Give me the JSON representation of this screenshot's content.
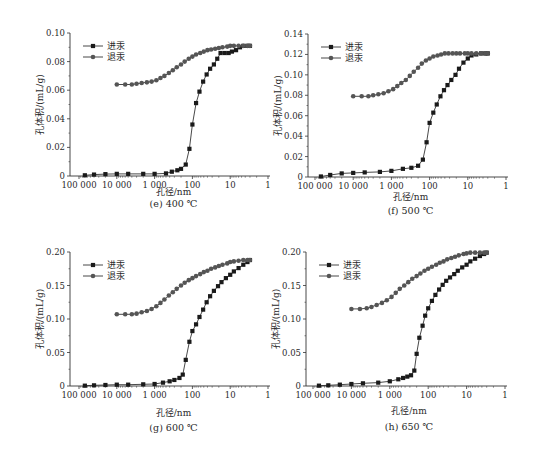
{
  "figure": {
    "series_names": {
      "intrusion": "进汞",
      "extrusion": "退汞"
    },
    "colors": {
      "line": "#1a1a1a",
      "intrusion_marker": "#1a1a1a",
      "extrusion_marker": "#555555",
      "axis": "#333333"
    }
  },
  "chart_data": [
    {
      "type": "line",
      "panel": "e",
      "caption": "(e) 400 ℃",
      "title": "",
      "xlabel": "孔径/nm",
      "ylabel": "孔体积/(mL/g)",
      "xscale": "log",
      "xreverse": true,
      "xlim": [
        100000,
        1
      ],
      "xticks": [
        100000,
        10000,
        1000,
        100,
        10,
        1
      ],
      "xtick_labels": [
        "100 000",
        "10 000",
        "1 000",
        "100",
        "10",
        "1"
      ],
      "ylim": [
        0,
        0.1
      ],
      "yticks": [
        0,
        0.02,
        0.04,
        0.06,
        0.08,
        0.1
      ],
      "ytick_labels": [
        "0",
        "0.02",
        "0.04",
        "0.06",
        "0.08",
        "0.10"
      ],
      "grid": false,
      "legend_position": "upper left",
      "series": [
        {
          "name": "进汞",
          "marker": "square",
          "x": [
            70000,
            40000,
            20000,
            10000,
            5000,
            2000,
            1000,
            500,
            350,
            250,
            200,
            150,
            120,
            100,
            80,
            65,
            52,
            42,
            34,
            27,
            22,
            18,
            14,
            11,
            9,
            7,
            5.5,
            4.5,
            3.5,
            3
          ],
          "y": [
            0.0005,
            0.001,
            0.0013,
            0.0015,
            0.0015,
            0.0015,
            0.0015,
            0.0018,
            0.003,
            0.004,
            0.005,
            0.008,
            0.019,
            0.036,
            0.051,
            0.059,
            0.066,
            0.071,
            0.075,
            0.078,
            0.082,
            0.086,
            0.086,
            0.086,
            0.087,
            0.088,
            0.09,
            0.091,
            0.091,
            0.091
          ]
        },
        {
          "name": "退汞",
          "marker": "circle",
          "x": [
            10000,
            6000,
            4000,
            3000,
            2200,
            1600,
            1200,
            900,
            700,
            550,
            420,
            330,
            260,
            200,
            160,
            125,
            100,
            80,
            62,
            50,
            40,
            32,
            25,
            20,
            16,
            12,
            10,
            8,
            6,
            4.5,
            3.5,
            3
          ],
          "y": [
            0.064,
            0.064,
            0.064,
            0.0645,
            0.065,
            0.0655,
            0.066,
            0.067,
            0.0685,
            0.07,
            0.072,
            0.074,
            0.076,
            0.078,
            0.08,
            0.082,
            0.0835,
            0.085,
            0.086,
            0.087,
            0.088,
            0.0885,
            0.089,
            0.0895,
            0.09,
            0.0905,
            0.091,
            0.091,
            0.091,
            0.091,
            0.091,
            0.091
          ]
        }
      ]
    },
    {
      "type": "line",
      "panel": "f",
      "caption": "(f) 500 ℃",
      "title": "",
      "xlabel": "孔径/nm",
      "ylabel": "孔体积/(mL/g)",
      "xscale": "log",
      "xreverse": true,
      "xlim": [
        100000,
        1
      ],
      "xticks": [
        100000,
        10000,
        1000,
        100,
        10,
        1
      ],
      "xtick_labels": [
        "100 000",
        "10 000",
        "1 000",
        "100",
        "10",
        "1"
      ],
      "ylim": [
        0,
        0.14
      ],
      "yticks": [
        0,
        0.02,
        0.04,
        0.06,
        0.08,
        0.1,
        0.12,
        0.14
      ],
      "ytick_labels": [
        "0",
        "0.02",
        "0.04",
        "0.06",
        "0.08",
        "0.10",
        "0.12",
        "0.14"
      ],
      "grid": false,
      "legend_position": "upper left",
      "series": [
        {
          "name": "进汞",
          "marker": "square",
          "x": [
            70000,
            40000,
            20000,
            10000,
            5000,
            2000,
            1000,
            500,
            300,
            200,
            150,
            120,
            100,
            80,
            65,
            52,
            42,
            34,
            27,
            21,
            17,
            13,
            10,
            8,
            6,
            4.5,
            3.5,
            3
          ],
          "y": [
            0.0005,
            0.002,
            0.0035,
            0.004,
            0.0045,
            0.005,
            0.006,
            0.008,
            0.009,
            0.011,
            0.017,
            0.034,
            0.053,
            0.063,
            0.071,
            0.079,
            0.085,
            0.09,
            0.095,
            0.1,
            0.106,
            0.112,
            0.116,
            0.119,
            0.12,
            0.121,
            0.121,
            0.121
          ]
        },
        {
          "name": "退汞",
          "marker": "circle",
          "x": [
            10000,
            6000,
            4000,
            3000,
            2200,
            1600,
            1200,
            900,
            700,
            550,
            420,
            330,
            260,
            200,
            160,
            125,
            100,
            80,
            62,
            50,
            40,
            32,
            25,
            20,
            16,
            12,
            10,
            8,
            6,
            4.5,
            3.5,
            3
          ],
          "y": [
            0.079,
            0.079,
            0.079,
            0.08,
            0.081,
            0.082,
            0.084,
            0.086,
            0.089,
            0.092,
            0.095,
            0.099,
            0.103,
            0.107,
            0.111,
            0.114,
            0.116,
            0.118,
            0.119,
            0.12,
            0.121,
            0.121,
            0.121,
            0.121,
            0.121,
            0.121,
            0.121,
            0.121,
            0.121,
            0.121,
            0.121,
            0.121
          ]
        }
      ]
    },
    {
      "type": "line",
      "panel": "g",
      "caption": "(g) 600 ℃",
      "title": "",
      "xlabel": "孔径/nm",
      "ylabel": "孔体积/(mL/g)",
      "xscale": "log",
      "xreverse": true,
      "xlim": [
        100000,
        1
      ],
      "xticks": [
        100000,
        10000,
        1000,
        100,
        10,
        1
      ],
      "xtick_labels": [
        "100 000",
        "10 000",
        "1 000",
        "100",
        "10",
        "1"
      ],
      "ylim": [
        0,
        0.2
      ],
      "yticks": [
        0,
        0.05,
        0.1,
        0.15,
        0.2
      ],
      "ytick_labels": [
        "0",
        "0.05",
        "0.10",
        "0.15",
        "0.20"
      ],
      "grid": false,
      "legend_position": "upper left",
      "series": [
        {
          "name": "进汞",
          "marker": "square",
          "x": [
            70000,
            40000,
            20000,
            10000,
            5000,
            2000,
            1000,
            600,
            400,
            300,
            220,
            180,
            150,
            120,
            100,
            80,
            65,
            52,
            42,
            34,
            27,
            21,
            17,
            13,
            10,
            8,
            6,
            4.5,
            3.5,
            3
          ],
          "y": [
            0.0005,
            0.001,
            0.0015,
            0.002,
            0.002,
            0.0025,
            0.003,
            0.005,
            0.007,
            0.009,
            0.012,
            0.017,
            0.039,
            0.066,
            0.082,
            0.092,
            0.103,
            0.114,
            0.125,
            0.134,
            0.142,
            0.149,
            0.155,
            0.161,
            0.166,
            0.171,
            0.176,
            0.181,
            0.185,
            0.188
          ]
        },
        {
          "name": "退汞",
          "marker": "circle",
          "x": [
            10000,
            6000,
            4000,
            3000,
            2200,
            1600,
            1200,
            900,
            700,
            550,
            420,
            330,
            260,
            200,
            160,
            125,
            100,
            80,
            62,
            50,
            40,
            32,
            25,
            20,
            16,
            12,
            10,
            8,
            6,
            4.5,
            3.5,
            3
          ],
          "y": [
            0.107,
            0.107,
            0.107,
            0.108,
            0.11,
            0.112,
            0.115,
            0.119,
            0.124,
            0.129,
            0.135,
            0.14,
            0.145,
            0.15,
            0.154,
            0.158,
            0.161,
            0.164,
            0.167,
            0.17,
            0.172,
            0.175,
            0.177,
            0.179,
            0.181,
            0.183,
            0.185,
            0.186,
            0.187,
            0.188,
            0.188,
            0.188
          ]
        }
      ]
    },
    {
      "type": "line",
      "panel": "h",
      "caption": "(h) 650 ℃",
      "title": "",
      "xlabel": "孔径/nm",
      "ylabel": "孔体积/(mL/g)",
      "xscale": "log",
      "xreverse": true,
      "xlim": [
        100000,
        1
      ],
      "xticks": [
        100000,
        10000,
        1000,
        100,
        10,
        1
      ],
      "xtick_labels": [
        "100 000",
        "10 000",
        "1 000",
        "100",
        "10",
        "1"
      ],
      "ylim": [
        0,
        0.2
      ],
      "yticks": [
        0,
        0.05,
        0.1,
        0.15,
        0.2
      ],
      "ytick_labels": [
        "0",
        "0.05",
        "0.10",
        "0.15",
        "0.20"
      ],
      "grid": false,
      "legend_position": "upper left",
      "series": [
        {
          "name": "进汞",
          "marker": "square",
          "x": [
            70000,
            40000,
            20000,
            10000,
            5000,
            2000,
            1000,
            600,
            450,
            350,
            280,
            230,
            200,
            170,
            140,
            120,
            100,
            80,
            65,
            52,
            42,
            34,
            27,
            21,
            17,
            13,
            10,
            8,
            6,
            4.5,
            3.5,
            3
          ],
          "y": [
            0.0005,
            0.001,
            0.002,
            0.003,
            0.004,
            0.005,
            0.007,
            0.01,
            0.012,
            0.014,
            0.016,
            0.023,
            0.048,
            0.072,
            0.09,
            0.105,
            0.116,
            0.127,
            0.136,
            0.144,
            0.151,
            0.157,
            0.162,
            0.167,
            0.172,
            0.177,
            0.181,
            0.186,
            0.19,
            0.194,
            0.197,
            0.199
          ]
        },
        {
          "name": "退汞",
          "marker": "circle",
          "x": [
            10000,
            6000,
            4000,
            3000,
            2200,
            1600,
            1200,
            900,
            700,
            550,
            420,
            330,
            260,
            200,
            160,
            125,
            100,
            80,
            62,
            50,
            40,
            32,
            25,
            20,
            16,
            12,
            10,
            8,
            6,
            4.5,
            3.5,
            3
          ],
          "y": [
            0.115,
            0.115,
            0.116,
            0.118,
            0.121,
            0.124,
            0.128,
            0.133,
            0.139,
            0.145,
            0.15,
            0.155,
            0.16,
            0.164,
            0.168,
            0.172,
            0.175,
            0.178,
            0.181,
            0.184,
            0.186,
            0.189,
            0.191,
            0.193,
            0.195,
            0.197,
            0.198,
            0.199,
            0.199,
            0.199,
            0.199,
            0.199
          ]
        }
      ]
    }
  ]
}
